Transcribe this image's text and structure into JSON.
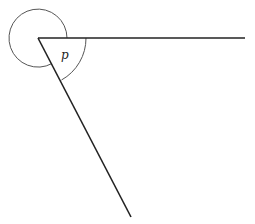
{
  "diagram": {
    "type": "angle-diagram",
    "vertex": {
      "x": 38,
      "y": 38
    },
    "rays": [
      {
        "name": "horizontal-ray",
        "end": {
          "x": 245,
          "y": 38
        }
      },
      {
        "name": "diagonal-ray",
        "end": {
          "x": 131,
          "y": 217
        }
      }
    ],
    "angles": [
      {
        "name": "angle-p",
        "label": "p",
        "radius": 48,
        "kind": "interior"
      },
      {
        "name": "reflex-angle",
        "label": "",
        "radius": 29,
        "kind": "reflex"
      }
    ],
    "colors": {
      "line": "#222222",
      "arc": "#555555",
      "background": "#ffffff"
    }
  }
}
